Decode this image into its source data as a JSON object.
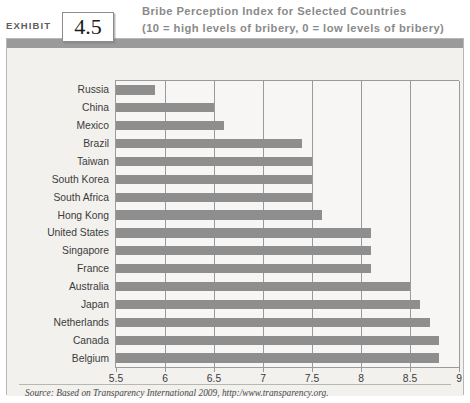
{
  "exhibit": {
    "label": "EXHIBIT",
    "number": "4.5"
  },
  "title": {
    "line1": "Bribe Perception Index for Selected Countries",
    "line2": "(10 = high levels of bribery, 0 = low levels of bribery)"
  },
  "source": {
    "text": "Source: Based on Transparency International 2009, http:/www.transparency.org."
  },
  "colors": {
    "bar": "#8e8e8e",
    "panel_background": "#f2f1ee",
    "panel_topbar": "#9a9a9a",
    "plot_background": "#f7f6f4",
    "gridline": "#9a9a9a",
    "title_text": "#8a8a8a",
    "label_text": "#3b3b3b"
  },
  "chart_data": {
    "type": "bar",
    "orientation": "horizontal",
    "title": "Bribe Perception Index for Selected Countries (10 = high levels of bribery, 0 = low levels of bribery)",
    "xlabel": "",
    "ylabel": "",
    "xlim": [
      5.5,
      9
    ],
    "xticks": [
      5.5,
      6,
      6.5,
      7,
      7.5,
      8,
      8.5,
      9
    ],
    "xtick_labels": [
      "5.5",
      "6",
      "6.5",
      "7",
      "7.5",
      "8",
      "8.5",
      "9"
    ],
    "grid": true,
    "legend": false,
    "categories": [
      "Russia",
      "China",
      "Mexico",
      "Brazil",
      "Taiwan",
      "South Korea",
      "South Africa",
      "Hong Kong",
      "United States",
      "Singapore",
      "France",
      "Australia",
      "Japan",
      "Netherlands",
      "Canada",
      "Belgium"
    ],
    "values": [
      5.9,
      6.5,
      6.6,
      7.4,
      7.5,
      7.5,
      7.5,
      7.6,
      8.1,
      8.1,
      8.1,
      8.5,
      8.6,
      8.7,
      8.8,
      8.8
    ]
  }
}
